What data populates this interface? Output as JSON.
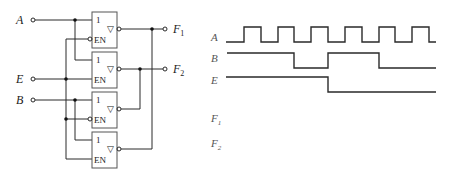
{
  "circuit": {
    "inputs": [
      {
        "name": "A",
        "y": 20
      },
      {
        "name": "E",
        "y": 79
      },
      {
        "name": "B",
        "y": 100
      }
    ],
    "outputs": [
      {
        "name": "F",
        "sub": "1",
        "y": 29
      },
      {
        "name": "F",
        "sub": "2",
        "y": 69
      }
    ],
    "gates": [
      {
        "id": 1,
        "label": "1",
        "enable_label": "EN",
        "enable_active_low": true,
        "type": "tri-state buffer",
        "input": "A",
        "enable": "E",
        "output": "F1"
      },
      {
        "id": 2,
        "label": "1",
        "enable_label": "EN",
        "enable_active_low": false,
        "type": "tri-state buffer",
        "input": "A",
        "enable": "E",
        "output": "F2"
      },
      {
        "id": 3,
        "label": "1",
        "enable_label": "EN",
        "enable_active_low": true,
        "type": "tri-state buffer",
        "input": "B",
        "enable": "E",
        "output": "F2"
      },
      {
        "id": 4,
        "label": "1",
        "enable_label": "EN",
        "enable_active_low": false,
        "type": "tri-state buffer",
        "input": "B",
        "enable": "E",
        "output": "F1"
      }
    ],
    "output_symbol": "▽"
  },
  "timing": {
    "signals": [
      {
        "name": "A",
        "sub": ""
      },
      {
        "name": "B",
        "sub": ""
      },
      {
        "name": "E",
        "sub": ""
      },
      {
        "name": "F",
        "sub": "1"
      },
      {
        "name": "F",
        "sub": "2"
      }
    ],
    "A_description": "square wave, 6 pulses",
    "B_description": "high, low during 3rd A pulse period, high, low from 5th A pulse",
    "E_description": "high then low from middle",
    "F1_description": "blank (to be drawn)",
    "F2_description": "blank (to be drawn)"
  }
}
